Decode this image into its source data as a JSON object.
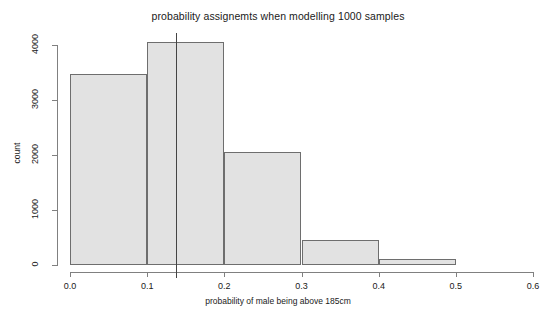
{
  "chart_data": {
    "type": "bar",
    "title": "probability assignemts when modelling 1000 samples",
    "xlabel": "probability of male being above 185cm",
    "ylabel": "count",
    "xlim": [
      0.0,
      0.6
    ],
    "ylim": [
      0,
      4000
    ],
    "grid": false,
    "legend": null,
    "bin_width": 0.1,
    "categories": [
      "0.0-0.1",
      "0.1-0.2",
      "0.2-0.3",
      "0.3-0.4",
      "0.4-0.5",
      "0.5-0.6"
    ],
    "bin_edges": [
      0.0,
      0.1,
      0.2,
      0.3,
      0.4,
      0.5,
      0.6
    ],
    "values": [
      3470,
      4060,
      2050,
      450,
      110,
      0
    ],
    "bar_fill_color": "#e2e2e2",
    "bar_border_color": "#6e6e6e",
    "xticks": [
      {
        "value": 0.0,
        "label": "0.0"
      },
      {
        "value": 0.1,
        "label": "0.1"
      },
      {
        "value": 0.2,
        "label": "0.2"
      },
      {
        "value": 0.3,
        "label": "0.3"
      },
      {
        "value": 0.4,
        "label": "0.4"
      },
      {
        "value": 0.5,
        "label": "0.5"
      },
      {
        "value": 0.6,
        "label": "0.6"
      }
    ],
    "yticks": [
      {
        "value": 0,
        "label": "0"
      },
      {
        "value": 1000,
        "label": "1000"
      },
      {
        "value": 2000,
        "label": "2000"
      },
      {
        "value": 3000,
        "label": "3000"
      },
      {
        "value": 4000,
        "label": "4000"
      }
    ],
    "annotations": [
      {
        "kind": "vertical-reference-line",
        "x": 0.137,
        "color": "#444444"
      }
    ]
  }
}
